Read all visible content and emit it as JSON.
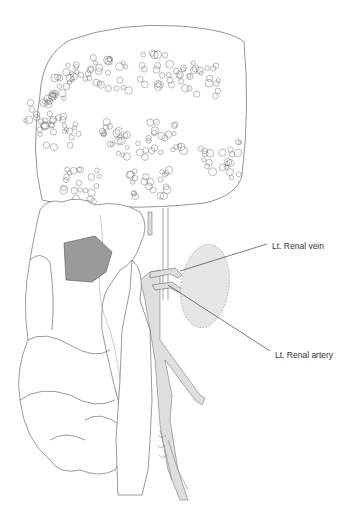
{
  "figure": {
    "type": "anatomical-illustration",
    "labels": {
      "renal_vein": "Lt. Renal vein",
      "renal_artery": "Lt. Renal artery"
    },
    "colors": {
      "outline": "#555555",
      "vessel_fill": "#dcdcdc",
      "kidney_fill": "#e6e6e6",
      "shaded_region": "#9a9a9a",
      "leader_line": "#444444"
    }
  }
}
